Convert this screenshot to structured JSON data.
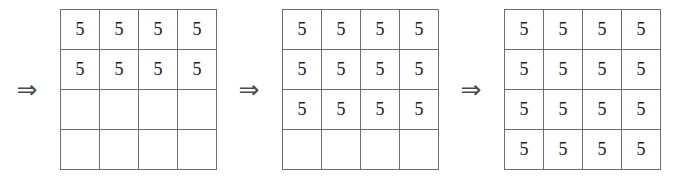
{
  "figure": {
    "arrow_symbol": "⇒",
    "cell_value": "5",
    "empty_value": "",
    "colors": {
      "grid_line": "#6e6e6e",
      "digit": "#1c1c1c",
      "arrow": "#4a4a4a",
      "background": "#ffffff"
    },
    "grid_size": {
      "rows": 4,
      "cols": 4
    },
    "steps": [
      {
        "index": 1,
        "arrow": "⇒",
        "filled_rows": 2,
        "rows": [
          [
            "5",
            "5",
            "5",
            "5"
          ],
          [
            "5",
            "5",
            "5",
            "5"
          ],
          [
            "",
            "",
            "",
            ""
          ],
          [
            "",
            "",
            "",
            ""
          ]
        ]
      },
      {
        "index": 2,
        "arrow": "⇒",
        "filled_rows": 3,
        "rows": [
          [
            "5",
            "5",
            "5",
            "5"
          ],
          [
            "5",
            "5",
            "5",
            "5"
          ],
          [
            "5",
            "5",
            "5",
            "5"
          ],
          [
            "",
            "",
            "",
            ""
          ]
        ]
      },
      {
        "index": 3,
        "arrow": "⇒",
        "filled_rows": 4,
        "rows": [
          [
            "5",
            "5",
            "5",
            "5"
          ],
          [
            "5",
            "5",
            "5",
            "5"
          ],
          [
            "5",
            "5",
            "5",
            "5"
          ],
          [
            "5",
            "5",
            "5",
            "5"
          ]
        ]
      }
    ]
  }
}
